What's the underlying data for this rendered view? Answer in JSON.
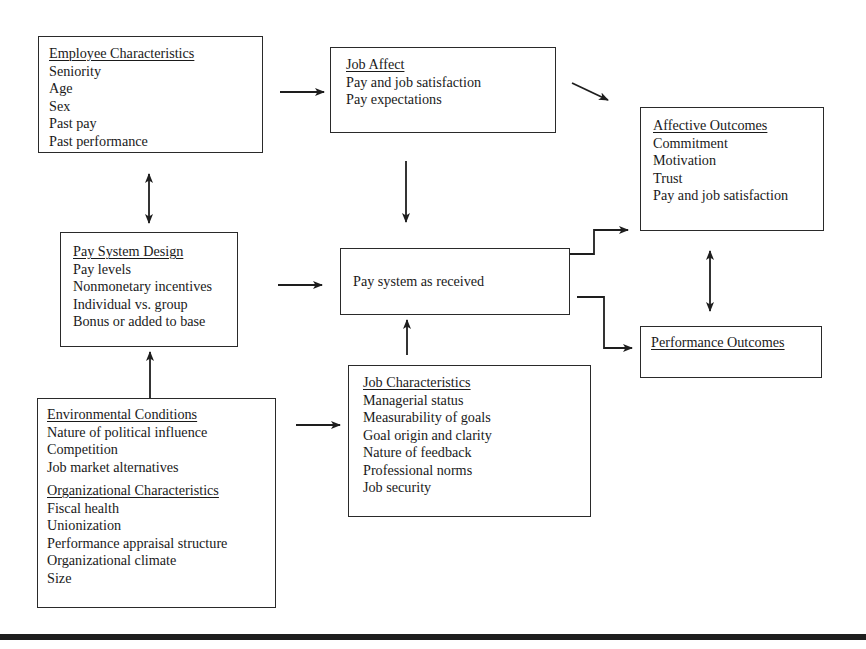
{
  "diagram": {
    "employee_characteristics": {
      "title": "Employee Characteristics",
      "items": [
        "Seniority",
        "Age",
        "Sex",
        "Past pay",
        "Past performance"
      ]
    },
    "job_affect": {
      "title": "Job Affect",
      "items": [
        "Pay and job satisfaction",
        "Pay expectations"
      ]
    },
    "affective_outcomes": {
      "title": "Affective Outcomes",
      "items": [
        "Commitment",
        "Motivation",
        "Trust",
        "Pay and job satisfaction"
      ]
    },
    "pay_system_design": {
      "title": "Pay System Design",
      "items": [
        "Pay levels",
        "Nonmonetary incentives",
        "Individual vs. group",
        "Bonus or added to base"
      ]
    },
    "pay_system_received": {
      "label": "Pay system as received"
    },
    "performance_outcomes": {
      "title": "Performance Outcomes"
    },
    "environmental_conditions": {
      "title": "Environmental Conditions",
      "items": [
        "Nature of political influence",
        "Competition",
        "Job market alternatives"
      ]
    },
    "organizational_characteristics": {
      "title": "Organizational Characteristics",
      "items": [
        "Fiscal health",
        "Unionization",
        "Performance appraisal structure",
        "Organizational climate",
        "Size"
      ]
    },
    "job_characteristics": {
      "title": "Job Characteristics",
      "items": [
        "Managerial status",
        "Measurability of goals",
        "Goal origin and clarity",
        "Nature of feedback",
        "Professional norms",
        "Job security"
      ]
    },
    "connections": [
      {
        "from": "Employee Characteristics",
        "to": "Job Affect",
        "type": "arrow"
      },
      {
        "from": "Employee Characteristics",
        "to": "Pay System Design",
        "type": "bidirectional"
      },
      {
        "from": "Job Affect",
        "to": "Affective Outcomes",
        "type": "arrow"
      },
      {
        "from": "Job Affect",
        "to": "Pay system as received",
        "type": "arrow"
      },
      {
        "from": "Pay System Design",
        "to": "Pay system as received",
        "type": "arrow"
      },
      {
        "from": "Environmental/Organizational",
        "to": "Pay System Design",
        "type": "arrow"
      },
      {
        "from": "Environmental/Organizational",
        "to": "Job Characteristics",
        "type": "arrow"
      },
      {
        "from": "Job Characteristics",
        "to": "Pay system as received",
        "type": "arrow"
      },
      {
        "from": "Pay system as received",
        "to": "Affective Outcomes",
        "type": "elbow-arrow"
      },
      {
        "from": "Pay system as received",
        "to": "Performance Outcomes",
        "type": "elbow-arrow"
      },
      {
        "from": "Affective Outcomes",
        "to": "Performance Outcomes",
        "type": "bidirectional"
      }
    ],
    "colors": {
      "line": "#1e1e1e",
      "background": "#ffffff"
    }
  }
}
